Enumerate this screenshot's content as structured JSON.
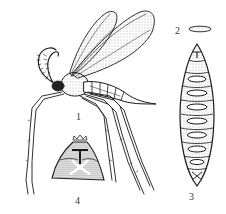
{
  "figure": {
    "type": "scientific-illustration",
    "style": "black-and-white line drawing with stippling",
    "colors": {
      "ink": "#1a1a1a",
      "stipple": "#555555",
      "background": "#ffffff"
    },
    "parts": [
      {
        "id": "1",
        "label": "1",
        "subject": "adult winged insect (lateral view)"
      },
      {
        "id": "2",
        "label": "2",
        "subject": "egg"
      },
      {
        "id": "3",
        "label": "3",
        "subject": "larva (dorsal view)"
      },
      {
        "id": "4",
        "label": "4",
        "subject": "terminal segment / head capsule"
      }
    ]
  }
}
